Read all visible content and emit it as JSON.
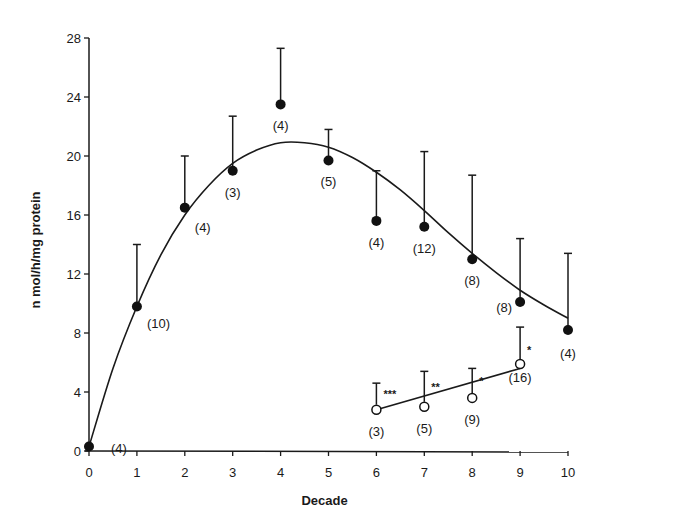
{
  "chart_data": {
    "type": "scatter",
    "title": "",
    "xlabel": "Decade",
    "ylabel": "n mol/h/mg protein",
    "xlim": [
      0,
      10
    ],
    "ylim": [
      0,
      28
    ],
    "x_ticks": [
      0,
      1,
      2,
      3,
      4,
      5,
      6,
      7,
      8,
      9,
      10
    ],
    "y_ticks": [
      0,
      4,
      8,
      12,
      16,
      20,
      24,
      28
    ],
    "grid": false,
    "legend": "none",
    "series": [
      {
        "name": "filled",
        "marker": "filled-circle",
        "points": [
          {
            "x": 0,
            "y": 0.3,
            "err_upper": null,
            "n": "(4)"
          },
          {
            "x": 1,
            "y": 9.8,
            "err_upper": 14.0,
            "n": "(10)"
          },
          {
            "x": 2,
            "y": 16.5,
            "err_upper": 20.0,
            "n": "(4)"
          },
          {
            "x": 3,
            "y": 19.0,
            "err_upper": 22.7,
            "n": "(3)"
          },
          {
            "x": 4,
            "y": 23.5,
            "err_upper": 27.3,
            "n": "(4)"
          },
          {
            "x": 5,
            "y": 19.7,
            "err_upper": 21.8,
            "n": "(5)"
          },
          {
            "x": 6,
            "y": 15.6,
            "err_upper": 19.0,
            "n": "(4)"
          },
          {
            "x": 7,
            "y": 15.2,
            "err_upper": 20.3,
            "n": "(12)"
          },
          {
            "x": 8,
            "y": 13.0,
            "err_upper": 18.7,
            "n": "(8)"
          },
          {
            "x": 9,
            "y": 10.1,
            "err_upper": 14.4,
            "n": "(8)"
          },
          {
            "x": 10,
            "y": 8.2,
            "err_upper": 13.4,
            "n": "(4)"
          }
        ],
        "fit_curve": [
          {
            "x": 0,
            "y": 0.3
          },
          {
            "x": 0.5,
            "y": 5.6
          },
          {
            "x": 1,
            "y": 9.8
          },
          {
            "x": 1.5,
            "y": 13.3
          },
          {
            "x": 2,
            "y": 16.0
          },
          {
            "x": 2.5,
            "y": 18.0
          },
          {
            "x": 3,
            "y": 19.5
          },
          {
            "x": 3.5,
            "y": 20.4
          },
          {
            "x": 4,
            "y": 20.9
          },
          {
            "x": 4.5,
            "y": 20.9
          },
          {
            "x": 5,
            "y": 20.6
          },
          {
            "x": 5.5,
            "y": 19.9
          },
          {
            "x": 6,
            "y": 18.9
          },
          {
            "x": 6.5,
            "y": 17.7
          },
          {
            "x": 7,
            "y": 16.3
          },
          {
            "x": 7.5,
            "y": 14.8
          },
          {
            "x": 8,
            "y": 13.4
          },
          {
            "x": 8.5,
            "y": 12.1
          },
          {
            "x": 9,
            "y": 10.9
          },
          {
            "x": 9.5,
            "y": 9.9
          },
          {
            "x": 10,
            "y": 9.0
          }
        ]
      },
      {
        "name": "open",
        "marker": "open-circle",
        "points": [
          {
            "x": 6,
            "y": 2.8,
            "err_upper": 4.6,
            "n": "(3)",
            "sig": "***"
          },
          {
            "x": 7,
            "y": 3.0,
            "err_upper": 5.4,
            "n": "(5)",
            "sig": "**"
          },
          {
            "x": 8,
            "y": 3.6,
            "err_upper": 5.6,
            "n": "(9)",
            "sig": "*"
          },
          {
            "x": 9,
            "y": 5.9,
            "err_upper": 8.4,
            "n": "(16)",
            "sig": "*"
          }
        ],
        "fit_line": [
          {
            "x": 6,
            "y": 2.8
          },
          {
            "x": 9,
            "y": 5.6
          }
        ]
      }
    ]
  }
}
